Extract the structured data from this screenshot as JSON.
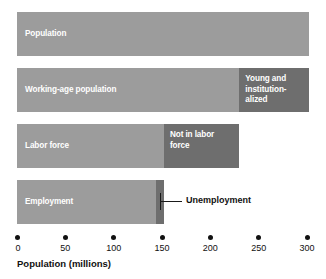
{
  "chart_data": {
    "type": "bar",
    "orientation": "horizontal",
    "title": "",
    "xlabel": "Population (millions)",
    "ylabel": "",
    "xlim": [
      0,
      300
    ],
    "xticks": [
      0,
      50,
      100,
      150,
      200,
      250,
      300
    ],
    "xticklabels": [
      "0",
      "50",
      "100",
      "150",
      "200",
      "250",
      "300"
    ],
    "grid": false,
    "legend": null,
    "colors": {
      "light_gray": "#9c9c9c",
      "dark_gray": "#6e6e6e",
      "text_light": "#ffffff",
      "text_dark": "#111111",
      "background": "#ffffff"
    },
    "categories": [
      "Population",
      "Working-age population",
      "Labor force",
      "Employment"
    ],
    "rows": [
      {
        "name": "population-row",
        "segments": [
          {
            "label": "Population",
            "value": 302,
            "start": 0,
            "color": "light_gray",
            "label_style": "inside-left"
          }
        ]
      },
      {
        "name": "working-age-row",
        "segments": [
          {
            "label": "Working-age population",
            "value": 230,
            "start": 0,
            "color": "light_gray",
            "label_style": "inside-left"
          },
          {
            "label": "Young and\ninstitution-\nalized",
            "value": 72,
            "start": 230,
            "color": "dark_gray",
            "label_style": "inside-block"
          }
        ]
      },
      {
        "name": "labor-force-row",
        "segments": [
          {
            "label": "Labor force",
            "value": 152,
            "start": 0,
            "color": "light_gray",
            "label_style": "inside-left"
          },
          {
            "label": "Not in labor\nforce",
            "value": 78,
            "start": 152,
            "color": "dark_gray",
            "label_style": "inside-block"
          }
        ]
      },
      {
        "name": "employment-row",
        "segments": [
          {
            "label": "Employment",
            "value": 144,
            "start": 0,
            "color": "light_gray",
            "label_style": "inside-left"
          },
          {
            "label": "",
            "value": 8,
            "start": 144,
            "color": "dark_gray",
            "label_style": "none"
          }
        ]
      }
    ],
    "annotations": [
      {
        "name": "unemployment-callout",
        "text": "Unemployment",
        "points_to_value": 148,
        "row": 3
      }
    ]
  },
  "axis": {
    "title": "Population (millions)"
  }
}
